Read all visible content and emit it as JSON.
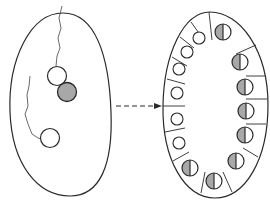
{
  "diagram": {
    "type": "biological-cell-division-schematic",
    "colors": {
      "stroke": "#2a2a2a",
      "fill_white": "#ffffff",
      "fill_gray": "#a8a8a8",
      "background": "#ffffff"
    },
    "left_cell": {
      "label": "",
      "nuclei": [
        {
          "id": "n1",
          "fill": "white",
          "cx": 57,
          "cy": 76,
          "r": 10
        },
        {
          "id": "n2",
          "fill": "gray",
          "cx": 67,
          "cy": 92,
          "r": 10
        },
        {
          "id": "n3",
          "fill": "white",
          "cx": 50,
          "cy": 138,
          "r": 10
        }
      ]
    },
    "arrow": {
      "style": "dashed",
      "direction": "right"
    },
    "right_structure": {
      "label": "",
      "left_column_cells": 6,
      "right_column_cells": 9,
      "left_cells_fill": "white",
      "right_cells_fill": "half-gray-half-white"
    }
  }
}
